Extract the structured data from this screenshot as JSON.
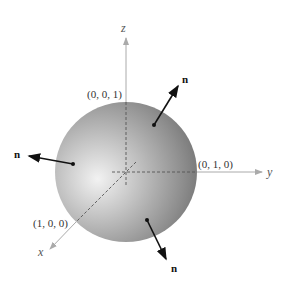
{
  "figure": {
    "axes": {
      "x": {
        "label": "x"
      },
      "y": {
        "label": "y"
      },
      "z": {
        "label": "z"
      }
    },
    "points": [
      {
        "label": "(0, 0, 1)"
      },
      {
        "label": "(0, 1, 0)"
      },
      {
        "label": "(1, 0, 0)"
      }
    ],
    "normals": [
      {
        "label": "n",
        "position": "upper-right"
      },
      {
        "label": "n",
        "position": "left"
      },
      {
        "label": "n",
        "position": "lower"
      }
    ],
    "colors": {
      "sphere_highlight": "#eeeeee",
      "sphere_mid": "#a8a8a8",
      "sphere_shadow": "#6e6e6e",
      "axis": "#aaaaaa",
      "arrow": "#111111"
    }
  }
}
